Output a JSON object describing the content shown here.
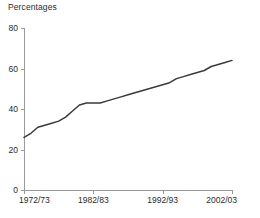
{
  "chart_data": {
    "type": "line",
    "title": "",
    "subtitle": "",
    "unit_label": "Percentages",
    "xlabel": "",
    "ylabel": "",
    "ylim": [
      0,
      80
    ],
    "yticks": [
      0,
      20,
      40,
      60,
      80
    ],
    "ytick_labels": [
      "0",
      "20",
      "40",
      "60",
      "80"
    ],
    "grid": false,
    "legend": null,
    "xtick_labels": [
      "1972/73",
      "1982/83",
      "1992/93",
      "2002/03"
    ],
    "xtick_values": [
      "1972/73",
      "1982/83",
      "1992/93",
      "2002/03"
    ],
    "x": [
      "1972/73",
      "1973/74",
      "1974/75",
      "1975/76",
      "1976/77",
      "1977/78",
      "1978/79",
      "1979/80",
      "1980/81",
      "1981/82",
      "1982/83",
      "1983/84",
      "1984/85",
      "1985/86",
      "1986/87",
      "1987/88",
      "1988/89",
      "1989/90",
      "1990/91",
      "1991/92",
      "1992/93",
      "1993/94",
      "1994/95",
      "1995/96",
      "1996/97",
      "1997/98",
      "1998/99",
      "1999/00",
      "2000/01",
      "2001/02",
      "2002/03"
    ],
    "values": [
      26,
      28,
      31,
      32,
      33,
      34,
      36,
      39,
      42,
      43,
      43,
      43,
      44,
      45,
      46,
      47,
      48,
      49,
      50,
      51,
      52,
      53,
      55,
      56,
      57,
      58,
      59,
      61,
      62,
      63,
      64
    ],
    "series": [
      {
        "name": "Percentages",
        "color": "#3a3a3a",
        "values": [
          26,
          28,
          31,
          32,
          33,
          34,
          36,
          39,
          42,
          43,
          43,
          43,
          44,
          45,
          46,
          47,
          48,
          49,
          50,
          51,
          52,
          53,
          55,
          56,
          57,
          58,
          59,
          61,
          62,
          63,
          64
        ]
      }
    ],
    "axis_color": "#9a9a9a",
    "text_color": "#2b2b2b",
    "background": "#ffffff"
  },
  "layout": {
    "plot_left": 24,
    "plot_right": 232,
    "plot_top": 28,
    "plot_bottom": 190
  }
}
